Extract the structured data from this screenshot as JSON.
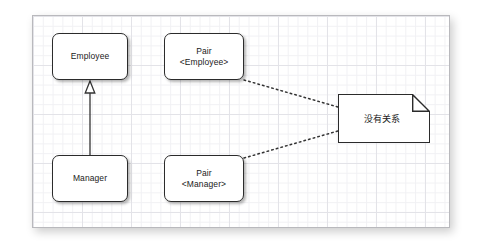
{
  "diagram": {
    "type": "uml-class-diagram",
    "canvas": {
      "background": "grid-paper",
      "grid_color": "#e3e3e8",
      "border_color": "#b9b9bd"
    },
    "nodes": [
      {
        "id": "employee",
        "label": "Employee",
        "shape": "rounded-rect"
      },
      {
        "id": "manager",
        "label": "Manager",
        "shape": "rounded-rect"
      },
      {
        "id": "pair_emp",
        "label": "Pair\n<Employee>",
        "shape": "rounded-rect"
      },
      {
        "id": "pair_mgr",
        "label": "Pair\n<Manager>",
        "shape": "rounded-rect"
      }
    ],
    "note": {
      "id": "note_no_relation",
      "label": "没有关系",
      "shape": "folded-corner-note"
    },
    "edges": [
      {
        "id": "inheritance",
        "from": "manager",
        "to": "employee",
        "style": "solid",
        "arrowhead": "hollow-triangle",
        "meaning": "generalization"
      },
      {
        "id": "note_link_employee",
        "from": "pair_emp",
        "to": "note_no_relation",
        "style": "dotted",
        "arrowhead": "none"
      },
      {
        "id": "note_link_manager",
        "from": "pair_mgr",
        "to": "note_no_relation",
        "style": "dotted",
        "arrowhead": "none"
      }
    ],
    "colors": {
      "node_border": "#2b2b2b",
      "node_fill": "#ffffff",
      "edge": "#333333",
      "text": "#1a1a1a"
    }
  }
}
